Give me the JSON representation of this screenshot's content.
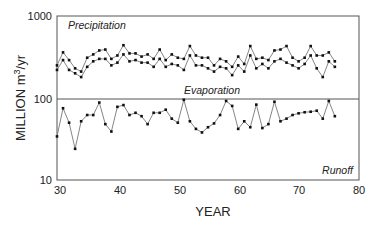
{
  "chart_data": {
    "type": "line",
    "title": "",
    "xlabel": "YEAR",
    "ylabel": "MILLION m3/yr",
    "ylabel_main": "MILLION m",
    "ylabel_sup": "3",
    "ylabel_tail": "/yr",
    "yscale": "log",
    "xlim": [
      30,
      80
    ],
    "ylim": [
      10,
      1000
    ],
    "x_ticks": [
      30,
      40,
      50,
      60,
      70,
      80
    ],
    "y_ticks": [
      10,
      100,
      1000
    ],
    "grid": false,
    "annotations": [
      "Precipitation",
      "Evaporation",
      "Runoff"
    ],
    "reference_line": {
      "y": 100,
      "note": "horizontal line at 100 separating upper and lower panels"
    },
    "x": [
      30,
      31,
      32,
      33,
      34,
      35,
      36,
      37,
      38,
      39,
      40,
      41,
      42,
      43,
      44,
      45,
      46,
      47,
      48,
      49,
      50,
      51,
      52,
      53,
      54,
      55,
      56,
      57,
      58,
      59,
      60,
      61,
      62,
      63,
      64,
      65,
      66,
      67,
      68,
      69,
      70,
      71,
      72,
      73,
      74,
      75,
      76
    ],
    "series": [
      {
        "name": "Precipitation (upper)",
        "values": [
          250,
          360,
          290,
          230,
          210,
          310,
          340,
          380,
          390,
          300,
          330,
          440,
          350,
          350,
          320,
          340,
          300,
          390,
          290,
          340,
          310,
          300,
          430,
          330,
          310,
          310,
          250,
          300,
          280,
          240,
          320,
          260,
          430,
          300,
          310,
          290,
          380,
          390,
          430,
          310,
          280,
          310,
          430,
          330,
          330,
          360,
          280
        ]
      },
      {
        "name": "Evaporation (lower precip band)",
        "values": [
          220,
          290,
          220,
          200,
          180,
          240,
          280,
          300,
          300,
          250,
          270,
          340,
          280,
          290,
          270,
          270,
          240,
          300,
          240,
          260,
          250,
          220,
          330,
          250,
          250,
          230,
          210,
          240,
          230,
          190,
          250,
          210,
          330,
          230,
          260,
          230,
          280,
          300,
          270,
          250,
          230,
          260,
          330,
          230,
          180,
          280,
          240
        ]
      },
      {
        "name": "Runoff",
        "values": [
          34,
          75,
          50,
          24,
          52,
          62,
          62,
          88,
          48,
          39,
          78,
          82,
          62,
          66,
          60,
          48,
          66,
          66,
          72,
          56,
          50,
          95,
          52,
          42,
          38,
          44,
          49,
          62,
          92,
          80,
          42,
          52,
          44,
          83,
          43,
          48,
          90,
          52,
          56,
          62,
          65,
          67,
          68,
          70,
          56,
          92,
          60
        ]
      }
    ]
  },
  "labels": {
    "precip": "Precipitation",
    "evap": "Evaporation",
    "runoff": "Runoff",
    "xlabel": "YEAR",
    "ylabel_main": "MILLION m",
    "ylabel_sup": "3",
    "ylabel_tail": "/yr",
    "yt1000": "1000",
    "yt100": "100",
    "yt10": "10",
    "xt30": "30",
    "xt40": "40",
    "xt50": "50",
    "xt60": "60",
    "xt70": "70",
    "xt80": "80"
  }
}
